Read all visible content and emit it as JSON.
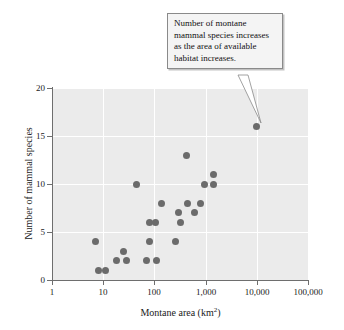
{
  "chart_data": {
    "type": "scatter",
    "title": "",
    "xlabel": "Montane area (km²)",
    "ylabel": "Number of mammal species",
    "xscale": "log",
    "yscale": "linear",
    "xlim": [
      1,
      100000
    ],
    "ylim": [
      0,
      20
    ],
    "x_tick_labels": [
      "1",
      "10",
      "100",
      "1,000",
      "10,000",
      "100,000"
    ],
    "x_tick_values": [
      1,
      10,
      100,
      1000,
      10000,
      100000
    ],
    "y_tick_labels": [
      "0",
      "5",
      "10",
      "15",
      "20"
    ],
    "y_tick_values": [
      0,
      5,
      10,
      15,
      20
    ],
    "grid": "white gridlines on light gray panel, horizontal at every y tick, vertical at every x tick",
    "legend": "none",
    "marker": {
      "shape": "circle",
      "color": "#6b6b6b",
      "size_px": 7
    },
    "plot_background": "#ebebeb",
    "points": [
      {
        "x": 7,
        "y": 4
      },
      {
        "x": 8,
        "y": 1
      },
      {
        "x": 11,
        "y": 1
      },
      {
        "x": 18,
        "y": 2
      },
      {
        "x": 25,
        "y": 3
      },
      {
        "x": 28,
        "y": 2
      },
      {
        "x": 44,
        "y": 10
      },
      {
        "x": 70,
        "y": 2
      },
      {
        "x": 80,
        "y": 6
      },
      {
        "x": 80,
        "y": 4
      },
      {
        "x": 105,
        "y": 6
      },
      {
        "x": 110,
        "y": 2
      },
      {
        "x": 140,
        "y": 8
      },
      {
        "x": 260,
        "y": 4
      },
      {
        "x": 300,
        "y": 7
      },
      {
        "x": 330,
        "y": 6
      },
      {
        "x": 430,
        "y": 13
      },
      {
        "x": 450,
        "y": 8
      },
      {
        "x": 600,
        "y": 7
      },
      {
        "x": 780,
        "y": 8
      },
      {
        "x": 950,
        "y": 10
      },
      {
        "x": 1400,
        "y": 11
      },
      {
        "x": 1450,
        "y": 10
      },
      {
        "x": 10000,
        "y": 16
      }
    ],
    "annotations": [
      {
        "name": "montane-species-callout",
        "text": "Number of montane mammal species increases as the area of available habitat increases.",
        "lines": [
          "Number of montane",
          "mammal species increases",
          "as the area of available",
          "habitat increases."
        ],
        "points_to": {
          "x": 10000,
          "y": 16
        }
      }
    ]
  },
  "axes": {
    "y_title": "Number of mammal species",
    "x_title_prefix": "Montane area (km",
    "x_title_sup": "2",
    "x_title_suffix": ")",
    "y_ticks": [
      {
        "label": "20"
      },
      {
        "label": "15"
      },
      {
        "label": "10"
      },
      {
        "label": "5"
      },
      {
        "label": "0"
      }
    ],
    "x_ticks": [
      {
        "label": "1"
      },
      {
        "label": "10"
      },
      {
        "label": "100"
      },
      {
        "label": "1,000"
      },
      {
        "label": "10,000"
      },
      {
        "label": "100,000"
      }
    ]
  },
  "annotation": {
    "line1": "Number of montane",
    "line2": "mammal species increases",
    "line3": "as the area of available",
    "line4": "habitat increases."
  },
  "colors": {
    "panel": "#ebebeb",
    "gridline": "#ffffff",
    "marker": "#6b6b6b",
    "axis": "#6e6e6e",
    "annotation_fill": "#f4f4f4",
    "annotation_border": "#8a8a8a"
  }
}
